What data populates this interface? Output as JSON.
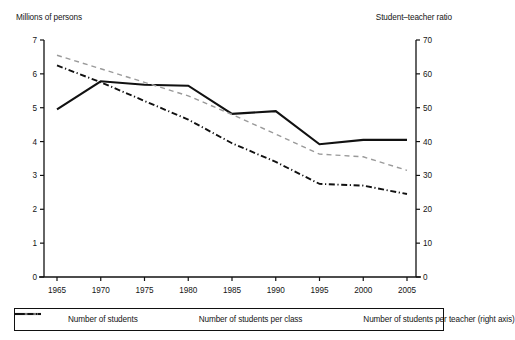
{
  "chart_data": {
    "type": "line",
    "title": "",
    "xlabel": "",
    "ylabel": "Millions of persons",
    "y2label": "Student–teacher ratio",
    "grid": false,
    "legend_position": "bottom",
    "x": [
      1965,
      1970,
      1975,
      1980,
      1985,
      1990,
      1995,
      2000,
      2005
    ],
    "categories": [
      "1965",
      "1970",
      "1975",
      "1980",
      "1985",
      "1990",
      "1995",
      "2000",
      "2005"
    ],
    "ylim": [
      0,
      7
    ],
    "yticks": [
      0,
      1,
      2,
      3,
      4,
      5,
      6,
      7
    ],
    "ytick_labels": [
      "0",
      "1",
      "2",
      "3",
      "4",
      "5",
      "6",
      "7"
    ],
    "y2lim": [
      0,
      70
    ],
    "y2ticks": [
      0,
      10,
      20,
      30,
      40,
      50,
      60,
      70
    ],
    "y2tick_labels": [
      "0",
      "10",
      "20",
      "30",
      "40",
      "50",
      "60",
      "70"
    ],
    "series": [
      {
        "name": "Number of students",
        "axis": "left",
        "style": "solid",
        "color": "#111111",
        "values": [
          4.95,
          5.78,
          5.68,
          5.65,
          4.82,
          4.9,
          3.92,
          4.05,
          4.05
        ]
      },
      {
        "name": "Number of students per class",
        "axis": "left",
        "style": "dashed",
        "color": "#9a9a9a",
        "values": [
          6.55,
          6.15,
          5.75,
          5.35,
          4.8,
          4.22,
          3.63,
          3.55,
          3.15
        ]
      },
      {
        "name": "Number of students per teacher (right axis)",
        "axis": "right",
        "style": "dashdot",
        "color": "#111111",
        "values": [
          62.5,
          57.5,
          52.0,
          46.5,
          39.5,
          34.0,
          27.5,
          27.0,
          24.5
        ]
      }
    ]
  },
  "axis_titles": {
    "left": "Millions of persons",
    "right": "Student–teacher ratio"
  },
  "legend": {
    "items": [
      {
        "label": "Number of students",
        "style": "solid"
      },
      {
        "label": "Number of students per class",
        "style": "dashed"
      },
      {
        "label": "Number of students per teacher (right axis)",
        "style": "dashdot"
      }
    ]
  }
}
